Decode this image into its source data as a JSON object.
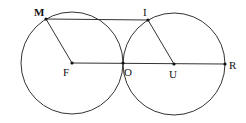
{
  "diagram": {
    "points": {
      "M": {
        "label": "M",
        "x": 46,
        "y": 19
      },
      "I": {
        "label": "I",
        "x": 148,
        "y": 20
      },
      "F": {
        "label": "F",
        "x": 72,
        "y": 63
      },
      "O": {
        "label": "O",
        "x": 123,
        "y": 63
      },
      "U": {
        "label": "U",
        "x": 174,
        "y": 64
      },
      "R": {
        "label": "R",
        "x": 225,
        "y": 64
      }
    },
    "circles": [
      {
        "center": "F",
        "radius": 51
      },
      {
        "center": "U",
        "radius": 51
      }
    ],
    "segments": [
      [
        "M",
        "I"
      ],
      [
        "M",
        "F"
      ],
      [
        "I",
        "U"
      ],
      [
        "F",
        "R"
      ]
    ],
    "line_color": "#333333"
  }
}
